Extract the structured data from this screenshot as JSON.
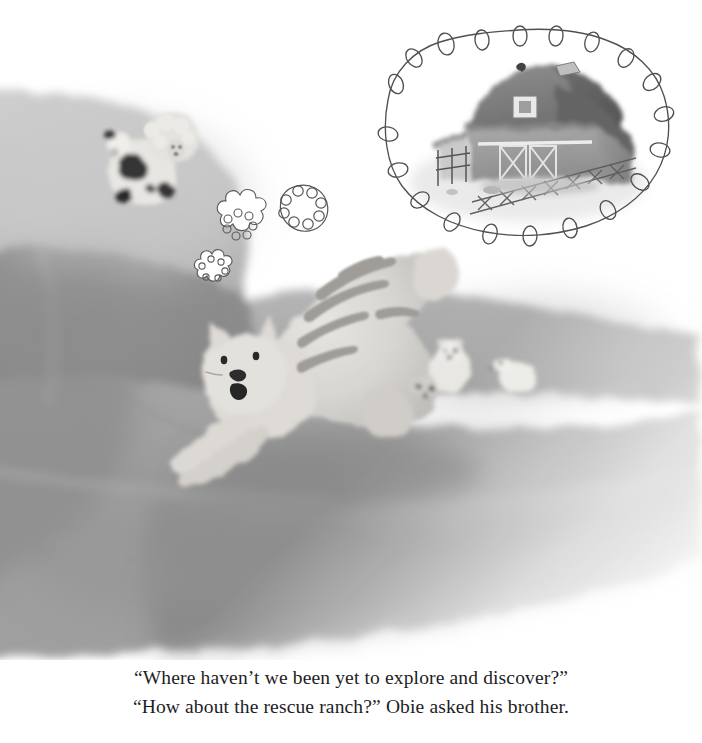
{
  "page": {
    "type": "picture-book-illustration-page",
    "background_color": "#ffffff",
    "palette": {
      "ink": "#4a4a4a",
      "paper": "#ffffff",
      "couch_light": "#c3c3c3",
      "couch_mid": "#a6a6a6",
      "couch_dark": "#8d8d8d",
      "couch_shadow": "#787878",
      "cat_body": "#d8d6d2",
      "cat_stripe": "#9a9a96",
      "barn_roof": "#7d7d7d",
      "barn_wall": "#9b9b9b",
      "text_color": "#1d1d1f"
    }
  },
  "illustration": {
    "name": "cat-stretching-on-couch-with-barn-daydream",
    "scene_description": "A grey tabby cat stretching on a couch while daydreaming of a barn, with small toy farm animals nearby.",
    "elements": {
      "thought_bubble": {
        "label": "thought bubble",
        "contents": "barn at a rescue ranch",
        "border_style": "hand-drawn looping scallops"
      },
      "barn": {
        "label": "barn",
        "features": [
          "gambrel roof",
          "hayloft door",
          "x-braced barn doors",
          "weather vane",
          "wooden fence"
        ]
      },
      "cat": {
        "label": "stretching tabby cat",
        "pose": "front-legs-extended stretch",
        "features": [
          "triangle ears",
          "two dot eyes",
          "dark nose",
          "open mouth",
          "striped back"
        ]
      },
      "puff_bubbles": {
        "label": "small thought puffs",
        "count": 3
      },
      "toy_cow": {
        "label": "spotted toy cow"
      },
      "toy_sheep": {
        "label": "fluffy toy sheep"
      },
      "toy_bear": {
        "label": "small toy bear"
      },
      "toy_duck": {
        "label": "small toy duck"
      },
      "couch": {
        "label": "couch cushions"
      }
    }
  },
  "caption": {
    "name": "story-caption",
    "lines": [
      "“Where haven’t we been yet to explore and discover?”",
      "“How about the rescue ranch?” Obie asked his brother."
    ],
    "line1": "“Where haven’t we been yet to explore and discover?”",
    "line2": "“How about the rescue ranch?” Obie asked his brother."
  }
}
